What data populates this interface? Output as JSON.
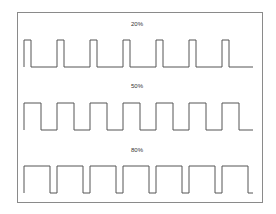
{
  "diagram": {
    "line_color": "#555555",
    "frame_color": "#8a8a8a",
    "period_px": 33,
    "pulse_count": 7,
    "waveforms": [
      {
        "label": "20%",
        "duty": 0.2,
        "label_y": 20,
        "top_y": 40,
        "bottom_y": 67
      },
      {
        "label": "50%",
        "duty": 0.5,
        "label_y": 82,
        "top_y": 103,
        "bottom_y": 130
      },
      {
        "label": "80%",
        "duty": 0.8,
        "label_y": 146,
        "top_y": 166,
        "bottom_y": 193
      }
    ],
    "x_start": 24,
    "x_end": 253
  }
}
